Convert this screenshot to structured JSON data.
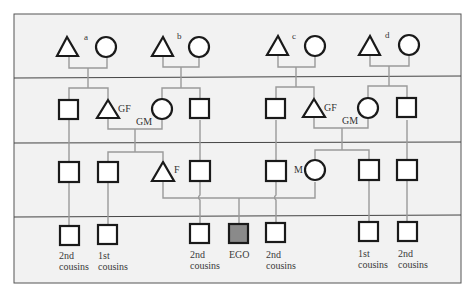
{
  "diagram": {
    "type": "kinship-chart",
    "colors": {
      "background": "#f2f2f2",
      "frame": "#555555",
      "symbol_stroke": "#1a1a1a",
      "symbol_fill": "#ffffff",
      "ego_fill": "#8a8a8a",
      "connector": "#9a9a9a"
    },
    "generations": [
      {
        "row": 1,
        "couples": [
          {
            "label": "a"
          },
          {
            "label": "b"
          },
          {
            "label": "c"
          },
          {
            "label": "d"
          }
        ]
      },
      {
        "row": 2,
        "labels": {
          "grandfather_left": "GF",
          "grandmother_left": "GM",
          "grandfather_right": "GF",
          "grandmother_right": "GM"
        }
      },
      {
        "row": 3,
        "labels": {
          "father": "F",
          "mother": "M"
        }
      },
      {
        "row": 4,
        "captions": [
          {
            "line1": "2nd",
            "line2": "cousins"
          },
          {
            "line1": "1st",
            "line2": "cousins"
          },
          {
            "line1": "2nd",
            "line2": "cousins"
          },
          {
            "line1": "EGO",
            "line2": ""
          },
          {
            "line1": "2nd",
            "line2": "cousins"
          },
          {
            "line1": "1st",
            "line2": "cousins"
          },
          {
            "line1": "2nd",
            "line2": "cousins"
          }
        ]
      }
    ],
    "legend_symbols": {
      "triangle": "male-triangle",
      "circle": "female-circle",
      "square": "unspecified-square",
      "filled_square": "ego"
    }
  }
}
